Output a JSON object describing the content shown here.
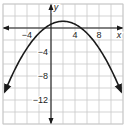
{
  "chart_data": {
    "type": "line",
    "title": "",
    "xlabel": "x",
    "ylabel": "y",
    "xlim": [
      -8,
      12
    ],
    "ylim": [
      -16,
      4
    ],
    "grid": true,
    "grid_step": 2,
    "x_ticks": [
      -4,
      4,
      8
    ],
    "y_ticks": [
      -4,
      -8,
      -12
    ],
    "x_tick_labels": [
      "−4",
      "4",
      "8"
    ],
    "y_tick_labels": [
      "−4",
      "−8",
      "−12"
    ],
    "series": [
      {
        "name": "parabola",
        "equation": "y = -(1/8)(x + 1)(x - 5)",
        "vertex": [
          2,
          1.125
        ],
        "x_intercepts": [
          -1,
          5
        ],
        "arrows_at_ends": true,
        "x": [
          -7.7,
          -6,
          -4,
          -2,
          -1,
          0,
          2,
          4,
          5,
          6,
          8,
          10,
          11.7
        ],
        "y": [
          -10.6,
          -8.9,
          -5.1,
          -1.9,
          0,
          0.6,
          1.1,
          0.6,
          0,
          -0.9,
          -3.4,
          -8.9,
          -10.6
        ]
      }
    ],
    "axis_arrows": true,
    "line_color": "#1a1a1a",
    "grid_color": "#c8c8c8"
  }
}
